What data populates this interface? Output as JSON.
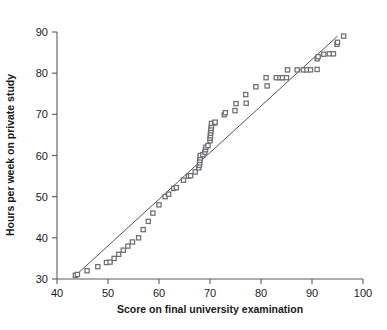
{
  "chart_data": {
    "type": "scatter",
    "title": "",
    "xlabel": "Score on final university examination",
    "ylabel": "Hours per week on private study",
    "xlim": [
      40,
      100
    ],
    "ylim": [
      30,
      90
    ],
    "xticks": [
      40,
      50,
      60,
      70,
      80,
      90,
      100
    ],
    "yticks": [
      30,
      40,
      50,
      60,
      70,
      80,
      90
    ],
    "grid": false,
    "legend": null,
    "marker": "open-square",
    "marker_color": "#6d6d76",
    "line_color": "#55555c",
    "reference_line": {
      "label": "reference line",
      "x": [
        43.5,
        95.0
      ],
      "y": [
        30.7,
        89.0
      ]
    },
    "points": [
      {
        "x": 43.6,
        "y": 30.9
      },
      {
        "x": 44.0,
        "y": 31.1
      },
      {
        "x": 45.9,
        "y": 32.0
      },
      {
        "x": 48.0,
        "y": 33.0
      },
      {
        "x": 49.7,
        "y": 34.0
      },
      {
        "x": 50.4,
        "y": 34.1
      },
      {
        "x": 51.2,
        "y": 35.0
      },
      {
        "x": 52.1,
        "y": 36.0
      },
      {
        "x": 53.0,
        "y": 37.0
      },
      {
        "x": 53.9,
        "y": 38.0
      },
      {
        "x": 54.8,
        "y": 39.0
      },
      {
        "x": 56.0,
        "y": 40.0
      },
      {
        "x": 56.9,
        "y": 42.0
      },
      {
        "x": 57.9,
        "y": 44.0
      },
      {
        "x": 58.8,
        "y": 46.0
      },
      {
        "x": 60.0,
        "y": 48.0
      },
      {
        "x": 61.2,
        "y": 50.0
      },
      {
        "x": 61.9,
        "y": 50.6
      },
      {
        "x": 62.9,
        "y": 52.0
      },
      {
        "x": 63.4,
        "y": 52.2
      },
      {
        "x": 64.8,
        "y": 54.0
      },
      {
        "x": 65.8,
        "y": 55.0
      },
      {
        "x": 66.2,
        "y": 55.1
      },
      {
        "x": 67.1,
        "y": 56.0
      },
      {
        "x": 67.8,
        "y": 57.0
      },
      {
        "x": 67.9,
        "y": 57.6
      },
      {
        "x": 68.0,
        "y": 58.2
      },
      {
        "x": 68.0,
        "y": 58.8
      },
      {
        "x": 68.1,
        "y": 59.4
      },
      {
        "x": 68.1,
        "y": 60.0
      },
      {
        "x": 68.6,
        "y": 60.2
      },
      {
        "x": 69.0,
        "y": 60.8
      },
      {
        "x": 69.1,
        "y": 61.4
      },
      {
        "x": 69.2,
        "y": 62.0
      },
      {
        "x": 69.6,
        "y": 62.4
      },
      {
        "x": 70.0,
        "y": 63.6
      },
      {
        "x": 70.0,
        "y": 64.2
      },
      {
        "x": 70.1,
        "y": 64.8
      },
      {
        "x": 70.1,
        "y": 65.4
      },
      {
        "x": 70.2,
        "y": 66.0
      },
      {
        "x": 70.2,
        "y": 66.6
      },
      {
        "x": 70.3,
        "y": 67.2
      },
      {
        "x": 70.3,
        "y": 67.8
      },
      {
        "x": 70.9,
        "y": 67.9
      },
      {
        "x": 71.0,
        "y": 68.1
      },
      {
        "x": 72.8,
        "y": 69.9
      },
      {
        "x": 73.0,
        "y": 70.4
      },
      {
        "x": 74.9,
        "y": 70.9
      },
      {
        "x": 75.1,
        "y": 72.6
      },
      {
        "x": 77.1,
        "y": 72.7
      },
      {
        "x": 77.0,
        "y": 74.8
      },
      {
        "x": 79.0,
        "y": 76.7
      },
      {
        "x": 81.0,
        "y": 78.9
      },
      {
        "x": 81.2,
        "y": 76.9
      },
      {
        "x": 83.0,
        "y": 78.9
      },
      {
        "x": 83.7,
        "y": 78.9
      },
      {
        "x": 84.2,
        "y": 78.9
      },
      {
        "x": 85.0,
        "y": 78.9
      },
      {
        "x": 85.2,
        "y": 80.8
      },
      {
        "x": 87.1,
        "y": 80.8
      },
      {
        "x": 88.3,
        "y": 80.8
      },
      {
        "x": 89.0,
        "y": 80.8
      },
      {
        "x": 89.7,
        "y": 80.8
      },
      {
        "x": 91.0,
        "y": 80.9
      },
      {
        "x": 91.0,
        "y": 83.5
      },
      {
        "x": 91.2,
        "y": 84.0
      },
      {
        "x": 92.3,
        "y": 84.6
      },
      {
        "x": 93.4,
        "y": 84.7
      },
      {
        "x": 94.2,
        "y": 84.7
      },
      {
        "x": 94.9,
        "y": 87.0
      },
      {
        "x": 95.0,
        "y": 87.5
      },
      {
        "x": 96.2,
        "y": 89.0
      }
    ]
  }
}
